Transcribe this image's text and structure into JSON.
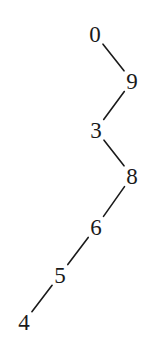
{
  "diagram": {
    "type": "binary-search-tree",
    "nodes": [
      {
        "id": "n0",
        "label": "0"
      },
      {
        "id": "n9",
        "label": "9"
      },
      {
        "id": "n3",
        "label": "3"
      },
      {
        "id": "n8",
        "label": "8"
      },
      {
        "id": "n6",
        "label": "6"
      },
      {
        "id": "n5",
        "label": "5"
      },
      {
        "id": "n4",
        "label": "4"
      }
    ],
    "edges": [
      {
        "from": "n0",
        "to": "n9",
        "side": "right"
      },
      {
        "from": "n9",
        "to": "n3",
        "side": "left"
      },
      {
        "from": "n3",
        "to": "n8",
        "side": "right"
      },
      {
        "from": "n8",
        "to": "n6",
        "side": "left"
      },
      {
        "from": "n6",
        "to": "n5",
        "side": "left"
      },
      {
        "from": "n5",
        "to": "n4",
        "side": "left"
      }
    ]
  }
}
